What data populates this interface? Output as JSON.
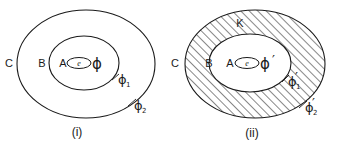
{
  "figure": {
    "background_color": "#ffffff",
    "ink_color": "#1a1a1a",
    "panels": [
      {
        "id": "panel-i",
        "caption": "(i)",
        "hatched": false,
        "labels": {
          "outer_region_label": "C",
          "middle_region_label": "B",
          "inner_region_label": "A",
          "core_label": "e",
          "map_label": "ϕ",
          "inner_boundary_label": "ϕ",
          "inner_boundary_sub": "1",
          "outer_boundary_label": "ϕ",
          "outer_boundary_sub": "2"
        }
      },
      {
        "id": "panel-ii",
        "caption": "(ii)",
        "hatched": true,
        "labels": {
          "outer_region_label": "C",
          "annulus_label": "K",
          "middle_region_label": "B",
          "inner_region_label": "A",
          "core_label": "e",
          "map_label": "ϕ",
          "map_prime": "′",
          "inner_boundary_label": "ϕ",
          "inner_boundary_sub": "1",
          "inner_boundary_prime": "′",
          "outer_boundary_label": "ϕ",
          "outer_boundary_sub": "2",
          "outer_boundary_prime": "′"
        }
      }
    ]
  }
}
